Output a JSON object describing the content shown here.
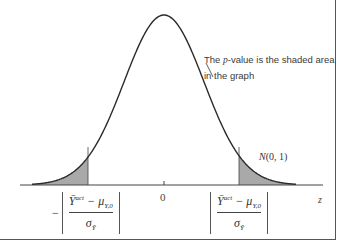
{
  "chart_data": {
    "type": "area",
    "title": "",
    "distribution": "N(0, 1)",
    "annotation": "The p-value is the shaded area in the graph",
    "xlabel": "z",
    "ylabel": "",
    "x_ticks": [
      "0"
    ],
    "mean": 0,
    "std": 1,
    "shaded_regions": [
      {
        "side": "left",
        "from": "-inf",
        "to": "-|(Ybar_act - mu_Y,0) / sigma_Ybar|"
      },
      {
        "side": "right",
        "from": "|(Ybar_act - mu_Y,0) / sigma_Ybar|",
        "to": "+inf"
      }
    ],
    "critical_value_labels": [
      "-|(Ȳ^act − μ_Y,0) / σ_Ȳ|",
      "|(Ȳ^act − μ_Y,0) / σ_Ȳ|"
    ],
    "fill_color": "#a9a9a9",
    "curve_color": "#2b2b2b",
    "grid": false
  },
  "labels": {
    "annotation_pre": "The ",
    "annotation_p": "p",
    "annotation_post": "-value is the shaded area",
    "annotation_line2": "in the graph",
    "dist_N": "N",
    "dist_params": "(0, 1)",
    "zero": "0",
    "z": "z",
    "minus": "−",
    "ybar": "Ȳ",
    "act": "act",
    "mu_term": " − μ",
    "mu_sub": "Y,0",
    "sigma": "σ",
    "sigma_sub": "Ȳ"
  }
}
